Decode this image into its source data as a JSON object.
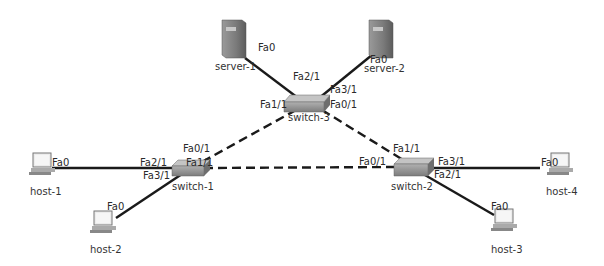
{
  "diagram": {
    "type": "network-topology",
    "nodes": {
      "server1": {
        "label": "server-1",
        "port": "Fa0"
      },
      "server2": {
        "label": "server-2",
        "port": "Fa0"
      },
      "switch3": {
        "label": "switch-3",
        "ports": [
          "Fa2/1",
          "Fa3/1",
          "Fa1/1",
          "Fa0/1"
        ]
      },
      "switch1": {
        "label": "switch-1",
        "ports": [
          "Fa0/1",
          "Fa2/1",
          "Fa1/1",
          "Fa3/1"
        ]
      },
      "switch2": {
        "label": "switch-2",
        "ports": [
          "Fa1/1",
          "Fa0/1",
          "Fa3/1",
          "Fa2/1"
        ]
      },
      "host1": {
        "label": "host-1",
        "port": "Fa0"
      },
      "host2": {
        "label": "host-2",
        "port": "Fa0"
      },
      "host3": {
        "label": "host-3",
        "port": "Fa0"
      },
      "host4": {
        "label": "host-4",
        "port": "Fa0"
      }
    },
    "links": [
      {
        "from": "server-1 Fa0",
        "to": "switch-3 Fa2/1",
        "style": "solid"
      },
      {
        "from": "server-2 Fa0",
        "to": "switch-3 Fa3/1",
        "style": "solid"
      },
      {
        "from": "switch-3 Fa1/1",
        "to": "switch-1 Fa0/1",
        "style": "dashed"
      },
      {
        "from": "switch-3 Fa0/1",
        "to": "switch-2 Fa1/1",
        "style": "dashed"
      },
      {
        "from": "switch-1 Fa1/1",
        "to": "switch-2 Fa0/1",
        "style": "dashed"
      },
      {
        "from": "host-1 Fa0",
        "to": "switch-1 Fa2/1",
        "style": "solid"
      },
      {
        "from": "host-2 Fa0",
        "to": "switch-1 Fa3/1",
        "style": "solid"
      },
      {
        "from": "host-3 Fa0",
        "to": "switch-2 Fa2/1",
        "style": "solid"
      },
      {
        "from": "host-4 Fa0",
        "to": "switch-2 Fa3/1",
        "style": "solid"
      }
    ]
  }
}
